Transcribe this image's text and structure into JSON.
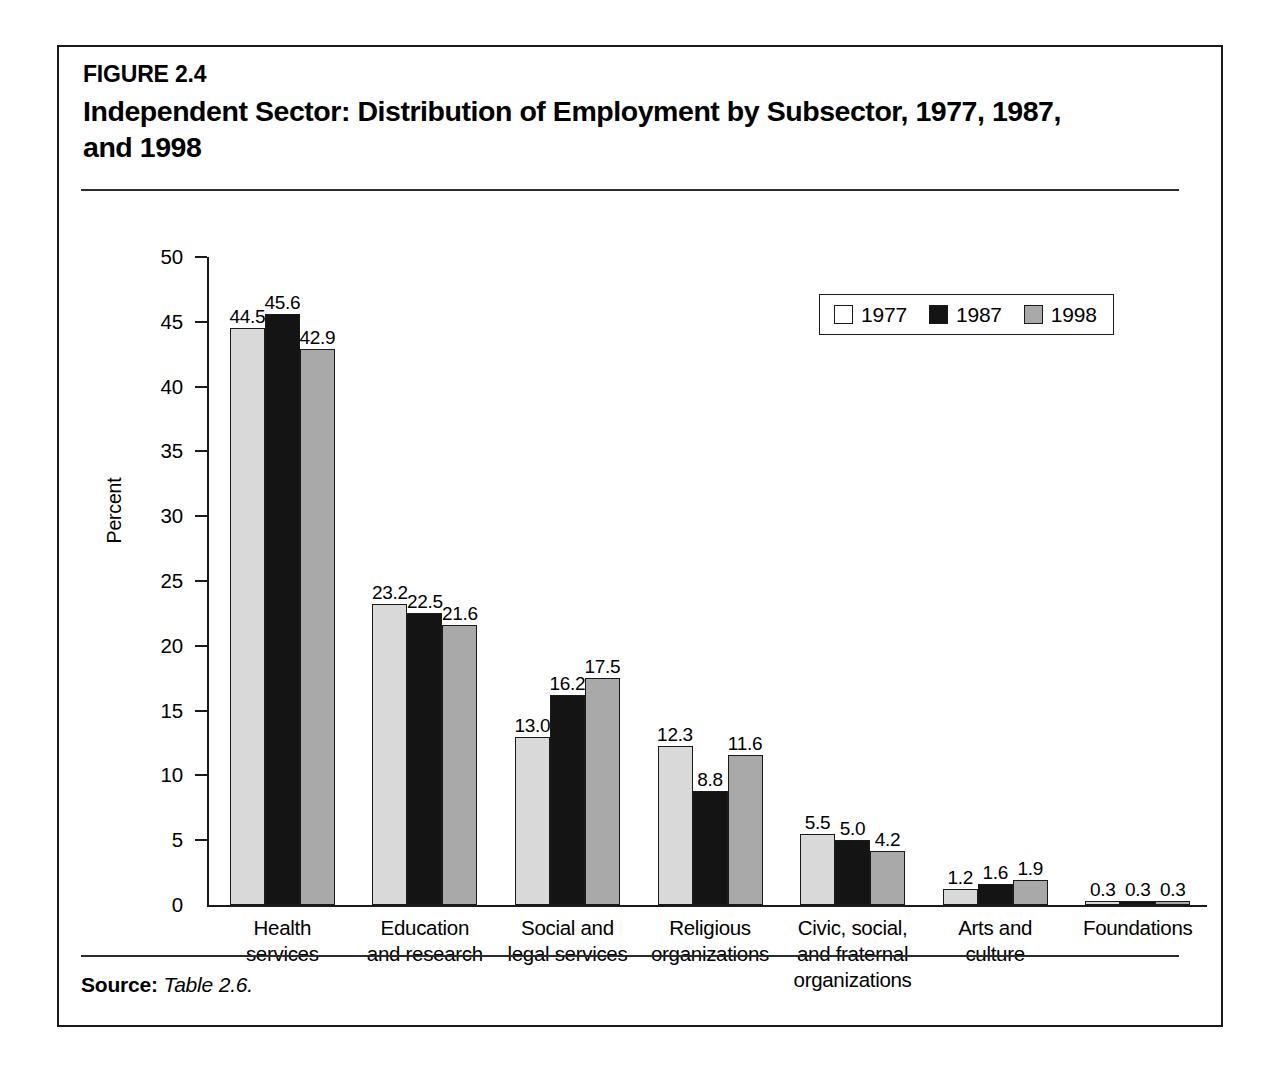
{
  "figure": {
    "number": "FIGURE 2.4",
    "title": "Independent Sector: Distribution of Employment by Subsector, 1977, 1987, and 1998",
    "source_key": "Source:",
    "source_value": "Table 2.6."
  },
  "colors": {
    "series_1977": "#d9d9d9",
    "series_1987": "#141414",
    "series_1998": "#a9a9a9",
    "axis": "#1a1a1a",
    "background": "#ffffff"
  },
  "chart_data": {
    "type": "bar",
    "title": "Independent Sector: Distribution of Employment by Subsector, 1977, 1987, and 1998",
    "xlabel": "",
    "ylabel": "Percent",
    "ylim": [
      0,
      50
    ],
    "yticks": [
      0,
      5,
      10,
      15,
      20,
      25,
      30,
      35,
      40,
      45,
      50
    ],
    "ytick_labels": [
      "0",
      "5",
      "10",
      "15",
      "20",
      "25",
      "30",
      "35",
      "40",
      "45",
      "50"
    ],
    "grid": false,
    "legend_position": "top-right",
    "categories": [
      "Health services",
      "Education and research",
      "Social and legal services",
      "Religious organizations",
      "Civic, social, and fraternal organizations",
      "Arts and culture",
      "Foundations"
    ],
    "category_lines": [
      [
        "Health",
        "services"
      ],
      [
        "Education",
        "and research"
      ],
      [
        "Social and",
        "legal services"
      ],
      [
        "Religious",
        "organizations"
      ],
      [
        "Civic, social,",
        "and fraternal",
        "organizations"
      ],
      [
        "Arts and",
        "culture"
      ],
      [
        "Foundations"
      ]
    ],
    "series": [
      {
        "name": "1977",
        "values": [
          44.5,
          23.2,
          13.0,
          12.3,
          5.5,
          1.2,
          0.3
        ],
        "labels": [
          "44.5",
          "23.2",
          "13.0",
          "12.3",
          "5.5",
          "1.2",
          "0.3"
        ]
      },
      {
        "name": "1987",
        "values": [
          45.6,
          22.5,
          16.2,
          8.8,
          5.0,
          1.6,
          0.3
        ],
        "labels": [
          "45.6",
          "22.5",
          "16.2",
          "8.8",
          "5.0",
          "1.6",
          "0.3"
        ]
      },
      {
        "name": "1998",
        "values": [
          42.9,
          21.6,
          17.5,
          11.6,
          4.2,
          1.9,
          0.3
        ],
        "labels": [
          "42.9",
          "21.6",
          "17.5",
          "11.6",
          "4.2",
          "1.9",
          "0.3"
        ]
      }
    ]
  },
  "legend": {
    "items": [
      {
        "label": "1977"
      },
      {
        "label": "1987"
      },
      {
        "label": "1998"
      }
    ]
  }
}
